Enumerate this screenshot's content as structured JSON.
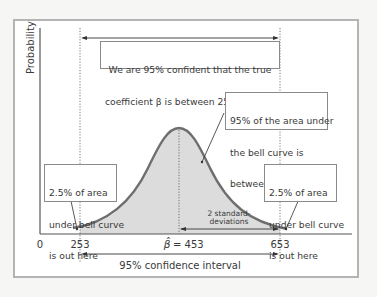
{
  "diagram": {
    "y_axis_label": "Probability",
    "top_box": {
      "line1": "We are 95% confident that the true",
      "line2": "coefficient β is between 253 and 653"
    },
    "center_box": {
      "line1": "95% of the area under",
      "line2": "the bell curve is",
      "line3": "between 253 and 653"
    },
    "left_tail_box": {
      "line1": "2.5% of area",
      "line2": "under bell curve",
      "line3": "is out here"
    },
    "right_tail_box": {
      "line1": "2.5% of area",
      "line2": "under bell curve",
      "line3": "is out here"
    },
    "std_label": {
      "line1": "2 standard-",
      "line2": "deviations"
    },
    "x_ticks": {
      "zero": "0",
      "lower": "253",
      "center": "= 453",
      "center_symbol": "β̂",
      "upper": "653"
    },
    "ci_label": "95% confidence interval",
    "colors": {
      "curve": "#6e6e6e",
      "fill": "#dcdcdc",
      "frame": "#b4b4b4",
      "text": "#3a3a3a"
    }
  }
}
